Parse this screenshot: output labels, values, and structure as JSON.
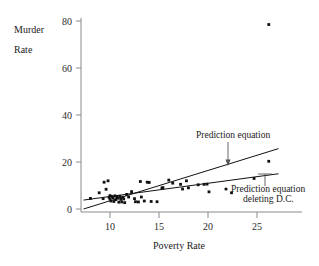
{
  "chart_data": {
    "type": "scatter",
    "title": "",
    "xlabel": "Poverty Rate",
    "ylabel_line1": "Murder",
    "ylabel_line2": "Rate",
    "xlim": [
      7.0,
      27.5
    ],
    "ylim": [
      0,
      84
    ],
    "grid": false,
    "legend_position": "inline-annotations",
    "xticks": [
      10,
      15,
      20,
      25
    ],
    "yticks": [
      0,
      20,
      40,
      60,
      80
    ],
    "xtick_labels": [
      "10",
      "15",
      "20",
      "25"
    ],
    "ytick_labels": [
      "0",
      "20",
      "40",
      "60",
      "80"
    ],
    "series": [
      {
        "name": "States",
        "marker": "square",
        "points": [
          [
            8.0,
            4.5
          ],
          [
            8.9,
            6.9
          ],
          [
            9.3,
            4.4
          ],
          [
            9.4,
            11.4
          ],
          [
            9.6,
            8.4
          ],
          [
            9.8,
            12.0
          ],
          [
            9.9,
            5.0
          ],
          [
            10.0,
            5.7
          ],
          [
            10.0,
            4.2
          ],
          [
            10.1,
            3.4
          ],
          [
            10.2,
            5.3
          ],
          [
            10.3,
            4.8
          ],
          [
            10.4,
            3.2
          ],
          [
            10.5,
            5.6
          ],
          [
            10.6,
            4.0
          ],
          [
            10.7,
            5.2
          ],
          [
            10.8,
            4.6
          ],
          [
            10.9,
            2.9
          ],
          [
            11.0,
            5.4
          ],
          [
            11.1,
            4.1
          ],
          [
            11.2,
            3.0
          ],
          [
            11.3,
            5.0
          ],
          [
            11.4,
            4.3
          ],
          [
            11.5,
            2.7
          ],
          [
            11.7,
            6.2
          ],
          [
            11.9,
            5.1
          ],
          [
            12.2,
            7.4
          ],
          [
            12.5,
            4.4
          ],
          [
            12.6,
            3.1
          ],
          [
            12.9,
            3.0
          ],
          [
            13.1,
            11.7
          ],
          [
            13.2,
            5.1
          ],
          [
            13.5,
            3.4
          ],
          [
            13.8,
            11.4
          ],
          [
            14.0,
            11.3
          ],
          [
            14.2,
            3.2
          ],
          [
            14.8,
            3.1
          ],
          [
            15.3,
            8.9
          ],
          [
            15.4,
            9.1
          ],
          [
            16.0,
            12.3
          ],
          [
            16.4,
            11.0
          ],
          [
            17.2,
            10.5
          ],
          [
            17.4,
            8.5
          ],
          [
            17.8,
            12.0
          ],
          [
            18.0,
            9.0
          ],
          [
            19.0,
            10.3
          ],
          [
            19.6,
            10.5
          ],
          [
            19.9,
            10.6
          ],
          [
            20.1,
            7.3
          ],
          [
            22.4,
            6.9
          ],
          [
            24.7,
            13.0
          ],
          [
            26.2,
            20.3
          ],
          [
            26.2,
            78.5
          ]
        ]
      }
    ],
    "lines": [
      {
        "name": "Prediction equation",
        "x_start": 7.3,
        "y_start": 0.0,
        "x_end": 27.2,
        "y_end": 25.7
      },
      {
        "name": "Prediction equation deleting D.C.",
        "x_start": 7.3,
        "y_start": 3.8,
        "x_end": 27.2,
        "y_end": 15.0
      }
    ],
    "annotations": [
      {
        "text": "Prediction equation",
        "target_x": 22.4,
        "target_y": 20.6
      },
      {
        "text_line1": "Prediction equation",
        "text_line2": "deleting D.C.",
        "target_x": 25.3,
        "target_y": 13.7
      }
    ]
  }
}
